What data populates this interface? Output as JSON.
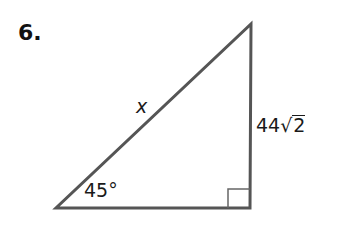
{
  "problem": {
    "number": "6."
  },
  "triangle": {
    "hypotenuse_label": "x",
    "angle_label": "45°",
    "leg_label": {
      "coefficient": "44",
      "radical_symbol": "√",
      "radicand": "2"
    },
    "right_angle_marker": true,
    "stroke_color": "#555555"
  }
}
